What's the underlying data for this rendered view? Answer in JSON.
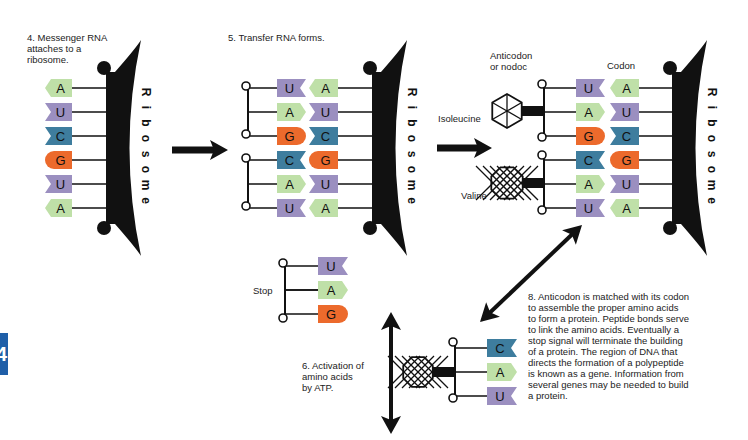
{
  "side_tab": {
    "label": "4",
    "color": "#1f5fa8"
  },
  "colors": {
    "A": "#bfe0a8",
    "U": "#9b8fc0",
    "C": "#3e7d9e",
    "G": "#ec6a2c",
    "ink": "#111111"
  },
  "steps": {
    "step4": {
      "text": "4.  Messenger RNA\n     attaches to a\n     ribosome."
    },
    "step5": {
      "text": "5. Transfer RNA forms."
    },
    "step6": {
      "text": "6.  Activation of\n     amino acids\n     by ATP."
    },
    "step8": {
      "text": "8.  Anticodon is matched with its codon\n     to assemble the proper amino acids\n     to form a protein. Peptide bonds serve\n     to link the amino acids. Eventually a\n     stop signal will terminate the building\n     of a protein. The region of DNA that\n     directs the formation of a polypeptide\n     is known as a gene. Information from\n     several genes may be needed to build\n     a protein."
    }
  },
  "labels": {
    "ribosome": "Ribosome",
    "anticodon": "Anticodon\nor nodoc",
    "codon": "Codon",
    "isoleucine": "Isoleucine",
    "valine": "Valine",
    "stop": "Stop"
  },
  "panel1": {
    "mrna": [
      "A",
      "U",
      "C",
      "G",
      "U",
      "A"
    ]
  },
  "panel2": {
    "trna": [
      "U",
      "A",
      "G",
      "C",
      "A",
      "U"
    ],
    "mrna": [
      "A",
      "U",
      "C",
      "G",
      "U",
      "A"
    ]
  },
  "panel3": {
    "trna": [
      "U",
      "A",
      "G",
      "C",
      "A",
      "U"
    ],
    "mrna": [
      "A",
      "U",
      "C",
      "G",
      "U",
      "A"
    ],
    "amino_acids": [
      "Isoleucine",
      "Valine"
    ]
  },
  "stop_codon": [
    "U",
    "A",
    "G"
  ],
  "activation_trna": [
    "C",
    "A",
    "U"
  ]
}
